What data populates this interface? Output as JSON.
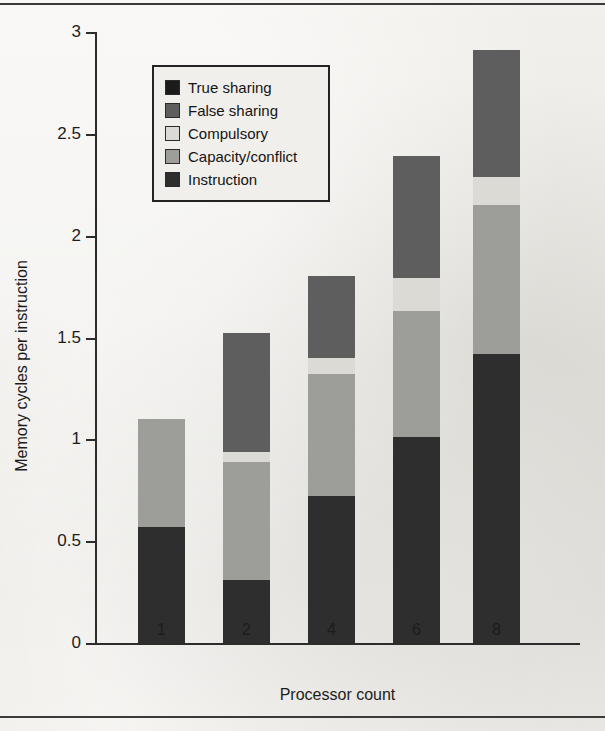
{
  "chart_data": {
    "type": "bar",
    "subtype": "stacked",
    "title": "",
    "xlabel": "Processor count",
    "ylabel": "Memory cycles per instruction",
    "categories": [
      "1",
      "2",
      "4",
      "6",
      "8"
    ],
    "ylim": [
      0,
      3
    ],
    "yticks": [
      0,
      0.5,
      1,
      1.5,
      2,
      2.5,
      3
    ],
    "ytick_labels": [
      "0",
      "0.5",
      "1",
      "1.5",
      "2",
      "2.5",
      "3"
    ],
    "grid": false,
    "legend_position": "upper-left-inside",
    "stack_order_bottom_to_top": [
      "Instruction",
      "Capacity/conflict",
      "Compulsory",
      "False sharing",
      "True sharing"
    ],
    "series": [
      {
        "name": "Instruction",
        "color": "#2e2e2e",
        "values": [
          0.57,
          0.31,
          0.72,
          1.01,
          1.42
        ]
      },
      {
        "name": "Capacity/conflict",
        "color": "#9d9d9a",
        "values": [
          0.53,
          0.58,
          0.6,
          0.62,
          0.73
        ]
      },
      {
        "name": "Compulsory",
        "color": "#dcdad5",
        "values": [
          0.0,
          0.05,
          0.08,
          0.16,
          0.14
        ]
      },
      {
        "name": "False sharing",
        "color": "#5e5e5e",
        "values": [
          0.0,
          0.58,
          0.4,
          0.6,
          0.62
        ]
      },
      {
        "name": "True sharing",
        "color": "#1b1b1b",
        "values": [
          0.0,
          0.0,
          0.0,
          0.0,
          0.0
        ]
      }
    ],
    "totals": [
      1.1,
      1.52,
      1.8,
      2.39,
      2.91
    ]
  },
  "legend": {
    "items": [
      {
        "label": "True sharing",
        "swatch": "sw-true"
      },
      {
        "label": "False sharing",
        "swatch": "sw-false"
      },
      {
        "label": "Compulsory",
        "swatch": "sw-compulsory"
      },
      {
        "label": "Capacity/conflict",
        "swatch": "sw-capacity"
      },
      {
        "label": "Instruction",
        "swatch": "sw-instruction"
      }
    ]
  }
}
